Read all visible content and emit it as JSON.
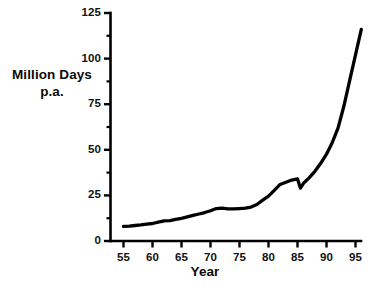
{
  "chart_data": {
    "type": "line",
    "title": "",
    "xlabel": "Year",
    "ylabel": "Million Days p.a.",
    "ylabel_lines": [
      "Million Days",
      "p.a."
    ],
    "xlim": [
      53,
      96.5
    ],
    "ylim": [
      0,
      125
    ],
    "grid": false,
    "legend": "none",
    "series_color": "#000000",
    "axis_color": "#000000",
    "x_ticks": [
      55,
      60,
      65,
      70,
      75,
      80,
      85,
      90,
      95
    ],
    "x_tick_labels": [
      "55",
      "60",
      "65",
      "70",
      "75",
      "80",
      "85",
      "90",
      "95"
    ],
    "y_ticks": [
      0,
      25,
      50,
      75,
      100,
      125
    ],
    "y_tick_labels": [
      "0",
      "25",
      "50",
      "75",
      "100",
      "125"
    ],
    "y_minor_ticks": [
      12.5,
      37.5,
      62.5,
      87.5,
      112.5
    ],
    "x": [
      55,
      56,
      57,
      58,
      59,
      60,
      61,
      62,
      63,
      64,
      65,
      66,
      67,
      68,
      69,
      70,
      71,
      72,
      73,
      74,
      75,
      76,
      77,
      78,
      79,
      80,
      81,
      82,
      83,
      84,
      85,
      85.5,
      86,
      87,
      88,
      89,
      90,
      91,
      92,
      93,
      94,
      95,
      96
    ],
    "values": [
      8,
      8.2,
      8.5,
      8.8,
      9.2,
      9.6,
      10.3,
      11,
      11.2,
      11.8,
      12.4,
      13.2,
      14,
      14.8,
      15.6,
      16.6,
      17.8,
      18,
      17.6,
      17.6,
      17.8,
      18,
      18.6,
      20,
      22.4,
      24.6,
      27.8,
      31,
      32.2,
      33.4,
      34,
      29,
      31.5,
      34.6,
      38.2,
      42.6,
      47.6,
      54,
      62,
      74,
      88,
      102,
      116
    ],
    "annotations": []
  }
}
